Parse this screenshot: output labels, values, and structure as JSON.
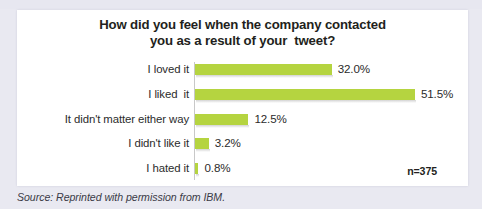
{
  "figure": {
    "background_color": "#e9e9f1",
    "panel_color": "#ffffff",
    "top_clipped_text": ". . .  .  .  .        .  .  .",
    "sample_size_label": "n=375",
    "source_note": "Source: Reprinted with permission from IBM."
  },
  "chart_data": {
    "type": "bar",
    "orientation": "horizontal",
    "title": "How did you feel when the company contacted you as a result of your tweet?",
    "title_lines": [
      "How did you feel when the company contacted",
      "you as a result of your  tweet?"
    ],
    "xlabel": "",
    "ylabel": "",
    "grid": false,
    "legend": false,
    "xlim": [
      0,
      51.5
    ],
    "value_suffix": "%",
    "bar_color": "#b5d440",
    "annotations": [
      "n=375"
    ],
    "categories": [
      "I loved it",
      "I liked  it",
      "It didn't matter either way",
      "I didn't like it",
      "I hated it"
    ],
    "values": [
      32.0,
      51.5,
      12.5,
      3.2,
      0.8
    ],
    "data_labels": [
      "32.0%",
      "51.5%",
      "12.5%",
      "3.2%",
      "0.8%"
    ]
  },
  "bars": [
    {
      "label": "I loved it",
      "value": 32.0,
      "data_label": "32.0%"
    },
    {
      "label": "I liked  it",
      "value": 51.5,
      "data_label": "51.5%"
    },
    {
      "label": "It didn't matter either way",
      "value": 12.5,
      "data_label": "12.5%"
    },
    {
      "label": "I didn't like it",
      "value": 3.2,
      "data_label": "3.2%"
    },
    {
      "label": "I hated it",
      "value": 0.8,
      "data_label": "0.8%"
    }
  ]
}
